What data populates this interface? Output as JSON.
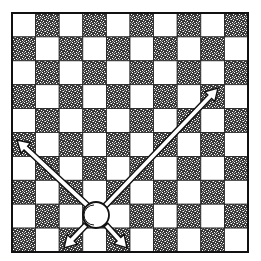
{
  "diagram": {
    "type": "draughts-board-move-diagram",
    "board": {
      "rows": 10,
      "cols": 10,
      "left": 12,
      "top": 13,
      "right": 248,
      "bottom": 252,
      "top_left_square": "light",
      "light_color": "#ffffff",
      "dark_color": "#1a1a1a",
      "border_color": "#111111"
    },
    "piece": {
      "kind": "man",
      "color": "white",
      "row": 8,
      "col": 3,
      "cx": 96,
      "cy": 215,
      "r": 13
    },
    "arrows": [
      {
        "name": "arrow-up-left",
        "x1": 88,
        "y1": 206,
        "x2": 17,
        "y2": 140
      },
      {
        "name": "arrow-up-right",
        "x1": 105,
        "y1": 206,
        "x2": 218,
        "y2": 88
      },
      {
        "name": "arrow-down-left",
        "x1": 86,
        "y1": 225,
        "x2": 64,
        "y2": 248
      },
      {
        "name": "arrow-down-right",
        "x1": 106,
        "y1": 225,
        "x2": 127,
        "y2": 248
      }
    ]
  }
}
